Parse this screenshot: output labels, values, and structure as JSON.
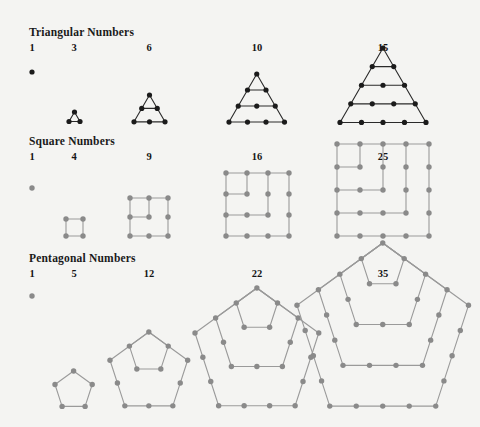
{
  "figure": {
    "background_color": "#f4f4f2",
    "title_present": false
  },
  "sections": [
    {
      "id": "triangular",
      "heading": "Triangular Numbers",
      "dot_color": "#1b1b1b",
      "line_color": "#2a2a2a",
      "labels": [
        "1",
        "3",
        "6",
        "10",
        "15"
      ]
    },
    {
      "id": "square",
      "heading": "Square Numbers",
      "dot_color": "#8a8a8a",
      "line_color": "#9a9a9a",
      "labels": [
        "1",
        "4",
        "9",
        "16",
        "25"
      ]
    },
    {
      "id": "pentagonal",
      "heading": "Pentagonal Numbers",
      "dot_color": "#8a8a8a",
      "line_color": "#9a9a9a",
      "labels": [
        "1",
        "5",
        "12",
        "22",
        "35"
      ]
    }
  ],
  "chart_data": {
    "type": "diagram",
    "series": [
      {
        "name": "Triangular Numbers",
        "categories": [
          "1",
          "3",
          "6",
          "10",
          "15"
        ],
        "values": [
          1,
          3,
          6,
          10,
          15
        ],
        "rows_per_figure": [
          1,
          2,
          3,
          4,
          5
        ],
        "formula": "n(n+1)/2"
      },
      {
        "name": "Square Numbers",
        "categories": [
          "1",
          "4",
          "9",
          "16",
          "25"
        ],
        "values": [
          1,
          4,
          9,
          16,
          25
        ],
        "grid_side_per_figure": [
          1,
          2,
          3,
          4,
          5
        ],
        "gnomons_per_figure": [
          0,
          1,
          2,
          3,
          4
        ],
        "formula": "n^2"
      },
      {
        "name": "Pentagonal Numbers",
        "categories": [
          "1",
          "5",
          "12",
          "22",
          "35"
        ],
        "values": [
          1,
          5,
          12,
          22,
          35
        ],
        "nested_pentagons_per_figure": [
          0,
          1,
          2,
          3,
          4
        ],
        "formula": "n(3n-1)/2"
      }
    ],
    "xlabel": "",
    "ylabel": "",
    "grid": false,
    "legend": "none"
  }
}
